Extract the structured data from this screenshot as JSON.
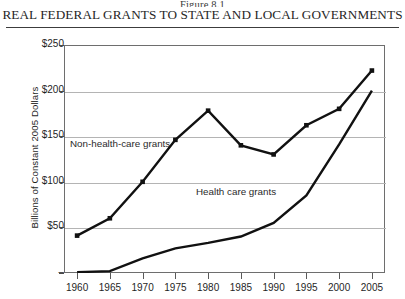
{
  "figure": {
    "number": "Figure 8.1",
    "title": "Real Federal Grants to State and Local Governments"
  },
  "chart_data": {
    "type": "line",
    "title": "Real Federal Grants to State and Local Governments",
    "subtitle": "Figure 8.1",
    "xlabel": "",
    "ylabel": "Billions of Constant 2005 Dollars",
    "x": [
      1960,
      1965,
      1970,
      1975,
      1980,
      1985,
      1990,
      1995,
      2000,
      2005
    ],
    "xtick_labels": [
      "1960",
      "1965",
      "1970",
      "1975",
      "1980",
      "1985",
      "1990",
      "1995",
      "2000",
      "2005"
    ],
    "xlim": [
      1958,
      2007
    ],
    "ylim": [
      0,
      250
    ],
    "ytick_values": [
      0,
      50,
      100,
      150,
      200,
      250
    ],
    "ytick_labels": [
      "–",
      "$50",
      "$100",
      "$150",
      "$200",
      "$250"
    ],
    "grid": true,
    "grid_axis": "y",
    "legend": "inline-labels",
    "series": [
      {
        "name": "Non-health-care grants",
        "label_text": "Non-health-care grants",
        "marker": "square",
        "color": "#111111",
        "values": [
          41,
          60,
          100,
          146,
          178,
          140,
          130,
          162,
          180,
          222
        ]
      },
      {
        "name": "Health care grants",
        "label_text": "Health care grants",
        "marker": "none",
        "color": "#111111",
        "values": [
          1,
          2,
          16,
          27,
          33,
          40,
          55,
          85,
          141,
          200
        ]
      }
    ]
  }
}
